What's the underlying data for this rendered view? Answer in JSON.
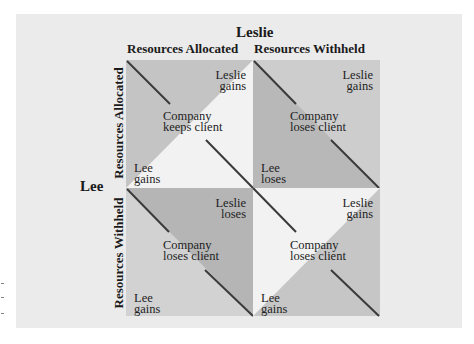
{
  "diagram": {
    "top_player": "Leslie",
    "left_player": "Lee",
    "columns": [
      "Resources Allocated",
      "Resources Withheld"
    ],
    "rows": [
      "Resources Allocated",
      "Resources Withheld"
    ],
    "cells": [
      {
        "position": "allocated-allocated",
        "leslie": [
          "Leslie",
          "gains"
        ],
        "outcome": [
          "Company",
          "keeps client"
        ],
        "lee": [
          "Lee",
          "gains"
        ]
      },
      {
        "position": "allocated-withheld",
        "leslie": [
          "Leslie",
          "gains"
        ],
        "outcome": [
          "Company",
          "loses client"
        ],
        "lee": [
          "Lee",
          "loses"
        ]
      },
      {
        "position": "withheld-allocated",
        "leslie": [
          "Leslie",
          "loses"
        ],
        "outcome": [
          "Company",
          "loses client"
        ],
        "lee": [
          "Lee",
          "gains"
        ]
      },
      {
        "position": "withheld-withheld",
        "leslie": [
          "Leslie",
          "gains"
        ],
        "outcome": [
          "Company",
          "loses client"
        ],
        "lee": [
          "Lee",
          "gains"
        ]
      }
    ],
    "colors": {
      "background": "#ebebeb",
      "dark_fill": "#b3b3b3",
      "mid_fill": "#c4c4c4",
      "light_fill": "#d2d2d2",
      "white_fill": "#f2f2f2",
      "diagonal_line": "#3a3a3a"
    }
  }
}
